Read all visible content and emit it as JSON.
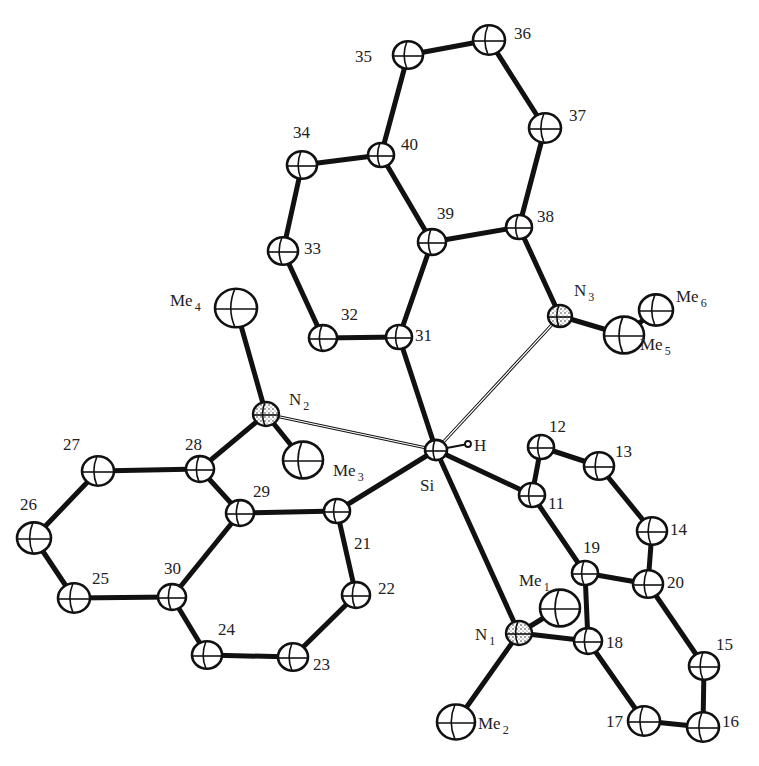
{
  "figure": {
    "type": "ORTEP molecular structure",
    "central_atom": "Si",
    "atoms": [
      {
        "id": "35",
        "label": "35",
        "x": 408,
        "y": 55,
        "r": 15,
        "lx": 355,
        "ly": 62
      },
      {
        "id": "36",
        "label": "36",
        "x": 489,
        "y": 40,
        "r": 16,
        "lx": 514,
        "ly": 39
      },
      {
        "id": "37",
        "label": "37",
        "x": 545,
        "y": 128,
        "r": 16,
        "lx": 569,
        "ly": 121
      },
      {
        "id": "40",
        "label": "40",
        "x": 381,
        "y": 155,
        "r": 13,
        "lx": 401,
        "ly": 150
      },
      {
        "id": "34",
        "label": "34",
        "x": 302,
        "y": 165,
        "r": 15,
        "lx": 293,
        "ly": 138
      },
      {
        "id": "39",
        "label": "39",
        "x": 432,
        "y": 242,
        "r": 14,
        "lx": 437,
        "ly": 219
      },
      {
        "id": "38",
        "label": "38",
        "x": 519,
        "y": 227,
        "r": 13,
        "lx": 537,
        "ly": 222
      },
      {
        "id": "33",
        "label": "33",
        "x": 283,
        "y": 251,
        "r": 15,
        "lx": 304,
        "ly": 254
      },
      {
        "id": "32",
        "label": "32",
        "x": 323,
        "y": 338,
        "r": 14,
        "lx": 341,
        "ly": 320
      },
      {
        "id": "31",
        "label": "31",
        "x": 399,
        "y": 337,
        "r": 13,
        "lx": 415,
        "ly": 341
      },
      {
        "id": "N3",
        "label": "N",
        "sub": "3",
        "x": 560,
        "y": 316,
        "r": 12,
        "lx": 574,
        "ly": 296,
        "nitrogen": true
      },
      {
        "id": "Me5",
        "label": "Me",
        "sub": "5",
        "x": 624,
        "y": 335,
        "r": 20,
        "lx": 640,
        "ly": 350
      },
      {
        "id": "Me6",
        "label": "Me",
        "sub": "6",
        "x": 656,
        "y": 310,
        "r": 17,
        "lx": 676,
        "ly": 302
      },
      {
        "id": "Me4",
        "label": "Me",
        "sub": "4",
        "x": 236,
        "y": 308,
        "r": 21,
        "lx": 170,
        "ly": 306
      },
      {
        "id": "N2",
        "label": "N",
        "sub": "2",
        "x": 266,
        "y": 414,
        "r": 13,
        "lx": 289,
        "ly": 405,
        "nitrogen": true
      },
      {
        "id": "Me3",
        "label": "Me",
        "sub": "3",
        "x": 303,
        "y": 460,
        "r": 20,
        "lx": 333,
        "ly": 476
      },
      {
        "id": "Si",
        "label": "Si",
        "x": 436,
        "y": 450,
        "r": 11,
        "lx": 420,
        "ly": 491
      },
      {
        "id": "H",
        "label": "H",
        "x": 468,
        "y": 444,
        "r": 3,
        "lx": 474,
        "ly": 451
      },
      {
        "id": "28",
        "label": "28",
        "x": 200,
        "y": 469,
        "r": 14,
        "lx": 185,
        "ly": 450
      },
      {
        "id": "27",
        "label": "27",
        "x": 98,
        "y": 471,
        "r": 16,
        "lx": 63,
        "ly": 450
      },
      {
        "id": "26",
        "label": "26",
        "x": 34,
        "y": 538,
        "r": 17,
        "lx": 20,
        "ly": 510
      },
      {
        "id": "25",
        "label": "25",
        "x": 74,
        "y": 598,
        "r": 16,
        "lx": 92,
        "ly": 584
      },
      {
        "id": "30",
        "label": "30",
        "x": 172,
        "y": 597,
        "r": 14,
        "lx": 164,
        "ly": 574
      },
      {
        "id": "29",
        "label": "29",
        "x": 240,
        "y": 513,
        "r": 14,
        "lx": 253,
        "ly": 497
      },
      {
        "id": "21",
        "label": "21",
        "x": 337,
        "y": 511,
        "r": 13,
        "lx": 354,
        "ly": 549
      },
      {
        "id": "22",
        "label": "22",
        "x": 356,
        "y": 595,
        "r": 14,
        "lx": 378,
        "ly": 594
      },
      {
        "id": "23",
        "label": "23",
        "x": 293,
        "y": 657,
        "r": 15,
        "lx": 313,
        "ly": 670
      },
      {
        "id": "24",
        "label": "24",
        "x": 207,
        "y": 655,
        "r": 15,
        "lx": 218,
        "ly": 635
      },
      {
        "id": "12",
        "label": "12",
        "x": 541,
        "y": 447,
        "r": 13,
        "lx": 549,
        "ly": 432
      },
      {
        "id": "13",
        "label": "13",
        "x": 599,
        "y": 466,
        "r": 15,
        "lx": 615,
        "ly": 457
      },
      {
        "id": "11",
        "label": "11",
        "x": 532,
        "y": 495,
        "r": 13,
        "lx": 548,
        "ly": 509
      },
      {
        "id": "14",
        "label": "14",
        "x": 652,
        "y": 531,
        "r": 15,
        "lx": 670,
        "ly": 535
      },
      {
        "id": "19",
        "label": "19",
        "x": 585,
        "y": 573,
        "r": 13,
        "lx": 583,
        "ly": 553
      },
      {
        "id": "20",
        "label": "20",
        "x": 648,
        "y": 584,
        "r": 15,
        "lx": 667,
        "ly": 588
      },
      {
        "id": "Me1",
        "label": "Me",
        "sub": "1",
        "x": 560,
        "y": 608,
        "r": 20,
        "lx": 519,
        "ly": 586
      },
      {
        "id": "N1",
        "label": "N",
        "sub": "1",
        "x": 519,
        "y": 633,
        "r": 13,
        "lx": 475,
        "ly": 640,
        "nitrogen": true
      },
      {
        "id": "18",
        "label": "18",
        "x": 588,
        "y": 641,
        "r": 14,
        "lx": 606,
        "ly": 648
      },
      {
        "id": "15",
        "label": "15",
        "x": 704,
        "y": 666,
        "r": 15,
        "lx": 716,
        "ly": 650
      },
      {
        "id": "17",
        "label": "17",
        "x": 644,
        "y": 721,
        "r": 16,
        "lx": 606,
        "ly": 727
      },
      {
        "id": "16",
        "label": "16",
        "x": 703,
        "y": 727,
        "r": 16,
        "lx": 722,
        "ly": 727
      },
      {
        "id": "Me2",
        "label": "Me",
        "sub": "2",
        "x": 456,
        "y": 722,
        "r": 19,
        "lx": 478,
        "ly": 729
      }
    ],
    "bonds": [
      [
        "35",
        "36",
        "thick"
      ],
      [
        "36",
        "37",
        "thick"
      ],
      [
        "35",
        "40",
        "thick"
      ],
      [
        "40",
        "34",
        "thick"
      ],
      [
        "40",
        "39",
        "thick"
      ],
      [
        "34",
        "33",
        "thick"
      ],
      [
        "33",
        "32",
        "thick"
      ],
      [
        "32",
        "31",
        "thick"
      ],
      [
        "31",
        "39",
        "thick"
      ],
      [
        "39",
        "38",
        "thick"
      ],
      [
        "38",
        "37",
        "thick"
      ],
      [
        "38",
        "N3",
        "thick"
      ],
      [
        "N3",
        "Me5",
        "thick"
      ],
      [
        "Me5",
        "Me6",
        "thick"
      ],
      [
        "31",
        "Si",
        "thick"
      ],
      [
        "N3",
        "Si",
        "weak"
      ],
      [
        "Me4",
        "N2",
        "thick"
      ],
      [
        "N2",
        "Me3",
        "thick"
      ],
      [
        "N2",
        "28",
        "thick"
      ],
      [
        "N2",
        "Si",
        "weak"
      ],
      [
        "28",
        "27",
        "thick"
      ],
      [
        "27",
        "26",
        "thick"
      ],
      [
        "26",
        "25",
        "thick"
      ],
      [
        "25",
        "30",
        "thick"
      ],
      [
        "30",
        "29",
        "thick"
      ],
      [
        "29",
        "28",
        "thick"
      ],
      [
        "29",
        "21",
        "thick"
      ],
      [
        "21",
        "22",
        "thick"
      ],
      [
        "22",
        "23",
        "thick"
      ],
      [
        "23",
        "24",
        "thick"
      ],
      [
        "24",
        "30",
        "thick"
      ],
      [
        "21",
        "Si",
        "thick"
      ],
      [
        "Si",
        "H",
        "thin"
      ],
      [
        "Si",
        "11",
        "thick"
      ],
      [
        "Si",
        "N1",
        "thick"
      ],
      [
        "11",
        "12",
        "thick"
      ],
      [
        "12",
        "13",
        "thick"
      ],
      [
        "13",
        "14",
        "thick"
      ],
      [
        "14",
        "20",
        "thick"
      ],
      [
        "11",
        "19",
        "thick"
      ],
      [
        "19",
        "20",
        "thick"
      ],
      [
        "19",
        "18",
        "thick"
      ],
      [
        "20",
        "15",
        "thick"
      ],
      [
        "15",
        "16",
        "thick"
      ],
      [
        "16",
        "17",
        "thick"
      ],
      [
        "17",
        "18",
        "thick"
      ],
      [
        "18",
        "N1",
        "thick"
      ],
      [
        "N1",
        "Me1",
        "thick"
      ],
      [
        "N1",
        "Me2",
        "thick"
      ]
    ]
  }
}
